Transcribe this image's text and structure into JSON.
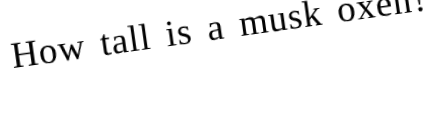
{
  "image": {
    "kind": "scanned-text-image",
    "background_color": "#ffffff",
    "text_color": "#0b0b0b",
    "width": 434,
    "height": 117
  },
  "content": {
    "question": "How tall is a musk oxen?",
    "words": [
      "How",
      "tall",
      "is",
      "a",
      "musk",
      "oxen?"
    ],
    "rotation_degrees": -8,
    "font_style": "serif"
  }
}
